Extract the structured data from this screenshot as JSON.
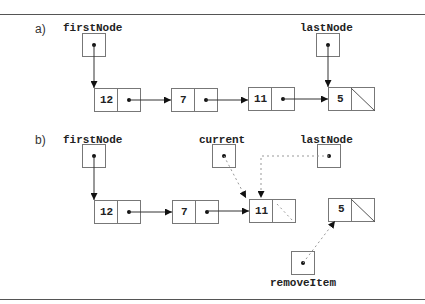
{
  "figure": {
    "part_a": {
      "label": "a)",
      "first_node_label": "firstNode",
      "last_node_label": "lastNode",
      "nodes": [
        {
          "value": "12",
          "next": "pointer"
        },
        {
          "value": "7",
          "next": "pointer"
        },
        {
          "value": "11",
          "next": "pointer"
        },
        {
          "value": "5",
          "next": "null"
        }
      ]
    },
    "part_b": {
      "label": "b)",
      "first_node_label": "firstNode",
      "current_label": "current",
      "last_node_label": "lastNode",
      "remove_item_label": "removeItem",
      "nodes": [
        {
          "value": "12",
          "next": "pointer"
        },
        {
          "value": "7",
          "next": "pointer"
        },
        {
          "value": "11",
          "next": "dashed-pointer"
        }
      ],
      "detached_node": {
        "value": "5",
        "next": "null"
      }
    },
    "colors": {
      "line": "#333333",
      "box_border": "#777777",
      "dashed": "#999999"
    }
  }
}
